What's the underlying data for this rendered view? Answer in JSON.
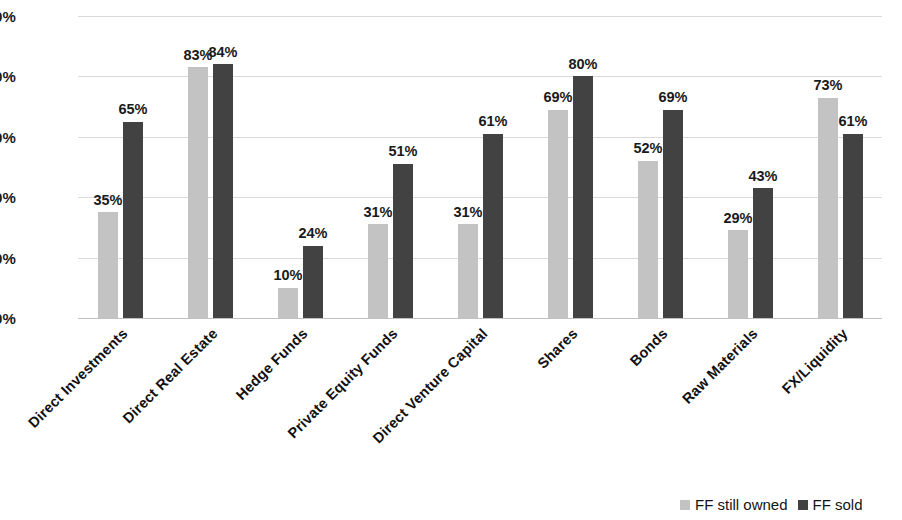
{
  "chart_data": {
    "type": "bar",
    "title": "",
    "subtitle": "",
    "xlabel": "",
    "ylabel": "",
    "ylim": [
      0,
      100
    ],
    "grid": true,
    "legend_position": "bottom-right",
    "value_suffix": "%",
    "categories": [
      "Direct Investments",
      "Direct Real Estate",
      "Hedge Funds",
      "Private Equity Funds",
      "Direct Venture Capital",
      "Shares",
      "Bonds",
      "Raw Materials",
      "FX/Liquidity"
    ],
    "series": [
      {
        "name": "FF still owned",
        "color": "#c3c3c3",
        "values": [
          35,
          83,
          10,
          31,
          31,
          69,
          52,
          29,
          73
        ],
        "labels": [
          "35%",
          "83%",
          "10%",
          "31%",
          "31%",
          "69%",
          "52%",
          "29%",
          "73%"
        ]
      },
      {
        "name": "FF sold",
        "color": "#424242",
        "values": [
          65,
          84,
          24,
          51,
          61,
          80,
          69,
          43,
          61
        ],
        "labels": [
          "65%",
          "84%",
          "24%",
          "51%",
          "61%",
          "80%",
          "69%",
          "43%",
          "61%"
        ]
      }
    ],
    "yticks": [
      {
        "value": 100,
        "label": "100%"
      },
      {
        "value": 80,
        "label": "80%"
      },
      {
        "value": 60,
        "label": "60%"
      },
      {
        "value": 40,
        "label": "40%"
      },
      {
        "value": 20,
        "label": "20%"
      },
      {
        "value": 0,
        "label": "0%"
      }
    ],
    "gridline_color": "#d9d9d9",
    "baseline_color": "#bfbfbf",
    "background_color": "#ffffff"
  },
  "legend": {
    "items": [
      {
        "label": "FF still owned",
        "color": "#c3c3c3"
      },
      {
        "label": "FF sold",
        "color": "#424242"
      }
    ]
  }
}
